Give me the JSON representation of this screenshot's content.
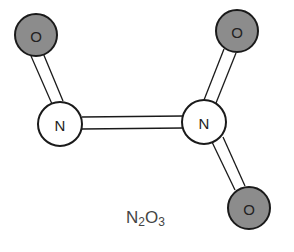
{
  "diagram": {
    "type": "molecule",
    "formula": {
      "parts": [
        {
          "el": "N",
          "sub": "2"
        },
        {
          "el": "O",
          "sub": "3"
        }
      ]
    },
    "colors": {
      "oxygen_fill": "#8c8c8c",
      "nitrogen_fill": "#ffffff",
      "stroke": "#1a1a1a"
    },
    "atoms": [
      {
        "id": "O1",
        "label": "O",
        "element": "oxygen",
        "x": 36,
        "y": 35,
        "r": 21
      },
      {
        "id": "N1",
        "label": "N",
        "element": "nitrogen",
        "x": 60,
        "y": 124,
        "r": 22
      },
      {
        "id": "N2",
        "label": "N",
        "element": "nitrogen",
        "x": 204,
        "y": 122,
        "r": 22
      },
      {
        "id": "O2",
        "label": "O",
        "element": "oxygen",
        "x": 237,
        "y": 31,
        "r": 21
      },
      {
        "id": "O3",
        "label": "O",
        "element": "oxygen",
        "x": 249,
        "y": 208,
        "r": 21
      }
    ],
    "bonds": [
      {
        "from": "O1",
        "to": "N1"
      },
      {
        "from": "N1",
        "to": "N2"
      },
      {
        "from": "N2",
        "to": "O2"
      },
      {
        "from": "N2",
        "to": "O3"
      }
    ]
  }
}
